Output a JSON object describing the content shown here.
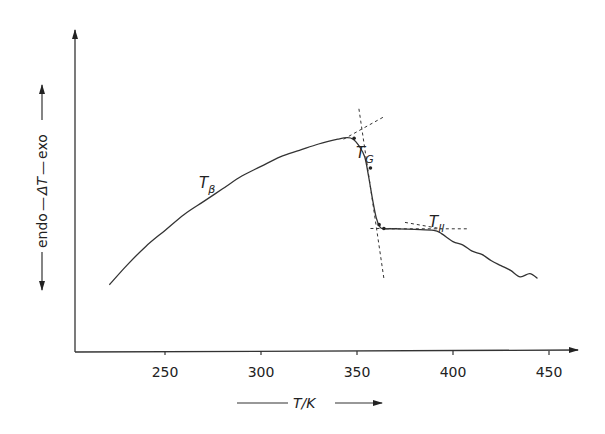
{
  "chart_data": {
    "type": "line",
    "title": "",
    "xlabel": "T/K",
    "xlabel_parts": {
      "var": "T",
      "sep": "/",
      "unit": "K"
    },
    "ylabel": "endo — ΔT — exo",
    "ylabel_parts": {
      "left": "endo",
      "var": "ΔT",
      "right": "exo"
    },
    "xlim": [
      220,
      460
    ],
    "ylim": [
      0,
      1
    ],
    "x_ticks": [
      250,
      300,
      350,
      400,
      450
    ],
    "x_tick_labels": [
      "250",
      "300",
      "350",
      "400",
      "450"
    ],
    "y_ticks": [],
    "grid": false,
    "series": [
      {
        "name": "DTA trace",
        "x": [
          221,
          230,
          240,
          250,
          260,
          270,
          280,
          290,
          300,
          310,
          320,
          330,
          340,
          345,
          348,
          351,
          354,
          356,
          358,
          360,
          362,
          364,
          367,
          370,
          380,
          390,
          394,
          400,
          405,
          410,
          415,
          420,
          425,
          430,
          435,
          440,
          444
        ],
        "y": [
          0.21,
          0.27,
          0.33,
          0.38,
          0.43,
          0.47,
          0.51,
          0.55,
          0.58,
          0.61,
          0.63,
          0.65,
          0.665,
          0.67,
          0.665,
          0.645,
          0.61,
          0.55,
          0.48,
          0.42,
          0.39,
          0.385,
          0.385,
          0.385,
          0.383,
          0.38,
          0.37,
          0.345,
          0.335,
          0.315,
          0.305,
          0.285,
          0.27,
          0.255,
          0.235,
          0.245,
          0.23
        ]
      }
    ],
    "annotations": [
      {
        "label": "T",
        "subscript": "β",
        "x": 280,
        "y": 0.54,
        "type": "text"
      },
      {
        "label": "T",
        "subscript": "G",
        "x": 354,
        "y": 0.76,
        "type": "text"
      },
      {
        "label": "T",
        "subscript": "ll",
        "x": 397,
        "y": 0.43,
        "type": "text"
      },
      {
        "type": "tangent-lines",
        "near_x": 351,
        "description": "dashed tangent construction at glass transition onset"
      },
      {
        "type": "tangent-lines",
        "near_x": 362,
        "description": "dashed tangent construction at glass transition end"
      },
      {
        "type": "tangent-lines",
        "near_x": 392,
        "description": "dashed tangent construction at T_ll"
      }
    ],
    "legend": "none"
  },
  "labels": {
    "tbeta_main": "T",
    "tbeta_sub": "β",
    "tg_main": "T",
    "tg_sub": "G",
    "tll_main": "T",
    "tll_sub": "ll",
    "x_axis_title": "T/K",
    "y_axis_left": "endo",
    "y_axis_var": "ΔT",
    "y_axis_right": "exo"
  }
}
